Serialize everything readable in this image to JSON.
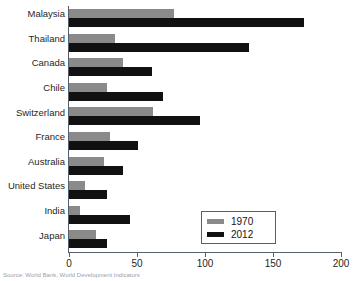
{
  "chart_data": {
    "type": "bar",
    "orientation": "horizontal",
    "title": "",
    "xlabel": "",
    "ylabel": "",
    "xlim": [
      0,
      200
    ],
    "xticks": [
      0,
      50,
      100,
      150,
      200
    ],
    "xtick_labels": [
      "0",
      "50",
      "100",
      "150",
      "200"
    ],
    "grid": false,
    "legend_position": "lower-right",
    "categories": [
      "Malaysia",
      "Thailand",
      "Canada",
      "Chile",
      "Switzerland",
      "France",
      "Australia",
      "United States",
      "India",
      "Japan"
    ],
    "series": [
      {
        "name": "1970",
        "color": "#8a8a8a",
        "values": [
          77,
          34,
          40,
          28,
          62,
          30,
          26,
          12,
          8,
          20
        ]
      },
      {
        "name": "2012",
        "color": "#111111",
        "values": [
          173,
          132,
          61,
          69,
          96,
          51,
          40,
          28,
          45,
          28
        ]
      }
    ]
  },
  "legend": {
    "entries": [
      {
        "label": "1970",
        "color": "#8a8a8a"
      },
      {
        "label": "2012",
        "color": "#111111"
      }
    ]
  },
  "caption": {
    "text": "Source: World Bank, World Development Indicators"
  }
}
